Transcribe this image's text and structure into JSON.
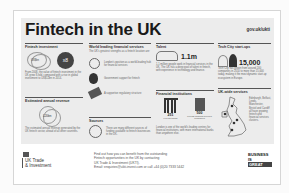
{
  "header": {
    "title": "Fintech in the UK",
    "url": "gov.uk/ukti"
  },
  "sections": {
    "investment": {
      "title": "Fintech investment",
      "badge_left": "US$bn",
      "badge_right": "x8",
      "text": "From 2008, the value of fintech investment in the UK grew 8-fold, compared with a rise in global investment to US$12bn in 2014."
    },
    "revenue": {
      "title": "Estimated annual revenue",
      "value": "£20bn",
      "text": "The estimated annual revenue generated by the UK fintech sector, ahead of all other countries."
    },
    "financial_services": {
      "title": "World leading financial services",
      "intro": "The UK's greatest strengths as a fintech location are:",
      "items": [
        {
          "icon": "globe-icon",
          "text": "London's position as a world-leading hub for financial services"
        },
        {
          "icon": "money-bag-icon",
          "text": "Government support for fintech"
        },
        {
          "icon": "handshake-icon",
          "text": "A supportive regulatory structure"
        }
      ]
    },
    "sources": {
      "title": "Sources",
      "text": "There are many different sources of funding available to fintech businesses in the UK."
    },
    "talent": {
      "title": "Talent",
      "value": "1.1m",
      "text": "1.1 million people work in financial services in the UK. The UK has a deep pool of talent in fintech, with experience in technology and finance."
    },
    "institutions": {
      "title": "Financial institutions",
      "left_value": "251",
      "left_label": "Foreign banks",
      "right_value": "500",
      "right_label": "Foreign financial services companies",
      "text": "London is one of the world's leading centres for financial institutions, with more international banks than anywhere else."
    },
    "startups": {
      "title": "Tech City start-ups",
      "value": "15,000",
      "text": "Tech City has grown from around 200 companies in 2010 to more than 15,000 today, making it the most dynamic start-up ecosystem in Europe."
    },
    "uk_wide": {
      "title": "UK-wide services",
      "text": "Edinburgh, Belfast, Leeds, Manchester, Bristol and Cardiff all have growing fintech and financial services clusters."
    }
  },
  "footer": {
    "org_line1": "UK Trade",
    "org_line2": "& Investment",
    "info": [
      "Find out how you can benefit from the outstanding",
      "Fintech opportunities in the UK by contacting",
      "UK Trade & Investment (UKTI).",
      "Email: enquiries@ukti-invest.com or call +44 (0)20 7333 5442"
    ],
    "brand_line1": "BUSINESS",
    "brand_line2": "IS",
    "brand_line3": "GREAT"
  }
}
